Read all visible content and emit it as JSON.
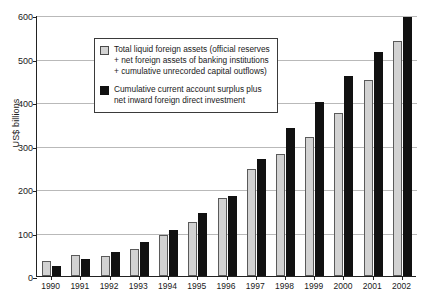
{
  "chart_data": {
    "type": "bar",
    "title": "",
    "xlabel": "",
    "ylabel": "US$ billions",
    "ylim": [
      0,
      600
    ],
    "ytick_step": 100,
    "yticks": [
      "0",
      "100",
      "200",
      "300",
      "400",
      "500",
      "600"
    ],
    "grid": true,
    "legend_position": "top-left-inside",
    "categories": [
      "1990",
      "1991",
      "1992",
      "1993",
      "1994",
      "1995",
      "1996",
      "1997",
      "1998",
      "1999",
      "2000",
      "2001",
      "2002"
    ],
    "series": [
      {
        "name": "Total liquid foreign assets (official reserves + net foreign assets of banking institutions + cumulative unrecorded capital outflows)",
        "short_name": "Total liquid foreign assets",
        "color": "#d2d2d2",
        "values": [
          35,
          48,
          45,
          62,
          95,
          125,
          180,
          245,
          280,
          320,
          375,
          450,
          540
        ]
      },
      {
        "name": "Cumulative current account surplus plus net inward foreign direct investment",
        "short_name": "Cumulative current account surplus",
        "color": "#111111",
        "values": [
          22,
          38,
          55,
          78,
          105,
          145,
          185,
          270,
          340,
          400,
          460,
          515,
          595
        ]
      }
    ]
  },
  "legend": {
    "items": [
      {
        "swatch": "light",
        "text": "Total liquid foreign assets (official reserves + net foreign assets of banking institutions + cumulative unrecorded capital outflows)"
      },
      {
        "swatch": "dark",
        "text": "Cumulative current account surplus plus net inward foreign direct investment"
      }
    ]
  }
}
